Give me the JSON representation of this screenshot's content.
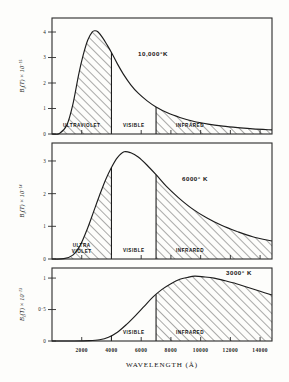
{
  "figure": {
    "xlabel": "WAVELENGTH (Å)",
    "x_ticks": [
      "2000",
      "4000",
      "6000",
      "8000",
      "10000",
      "12000",
      "14000"
    ],
    "x_tick_values": [
      2000,
      4000,
      6000,
      8000,
      10000,
      12000,
      14000
    ],
    "xlim": [
      0,
      14800
    ],
    "visible_band": [
      4000,
      7000
    ],
    "degree_symbol": "°",
    "kelvin_symbol": "K"
  },
  "chart_data": {
    "type": "line",
    "title": "",
    "xlabel": "WAVELENGTH (Å)",
    "ylabel": "Bλ(T)",
    "xlim": [
      0,
      14800
    ],
    "grid": false,
    "legend": "none",
    "panels": [
      {
        "id": "panel-10000k",
        "temperature_label": "10,000°K",
        "temperature_value": 10000,
        "y_axis_label_base": "B",
        "y_axis_label_sub": "λ",
        "y_axis_label_mid": "(T) × 10",
        "y_axis_label_exp": "−15",
        "y_ticks": [
          "1",
          "2",
          "3",
          "4"
        ],
        "y_tick_values": [
          1,
          2,
          3,
          4
        ],
        "ylim": [
          0,
          4.55
        ],
        "zero_tick": "0",
        "peak_wavelength": 2900,
        "peak_value": 4.05,
        "bands": [
          {
            "name": "ULTRAVIOLET",
            "range": [
              0,
              4000
            ],
            "hatched": true
          },
          {
            "name": "VISIBLE",
            "range": [
              4000,
              7000
            ],
            "hatched": false
          },
          {
            "name": "INFRARED",
            "range": [
              7000,
              14800
            ],
            "hatched": true
          }
        ],
        "x": [
          0,
          500,
          1000,
          1400,
          1800,
          2100,
          2400,
          2700,
          2900,
          3100,
          3400,
          3700,
          4000,
          4400,
          4800,
          5300,
          5800,
          6400,
          7000,
          7800,
          8600,
          9500,
          10500,
          11500,
          12500,
          13500,
          14800
        ],
        "y": [
          0,
          0.02,
          0.35,
          1.15,
          2.35,
          3.1,
          3.68,
          4.0,
          4.05,
          4.0,
          3.78,
          3.5,
          3.2,
          2.75,
          2.35,
          1.93,
          1.6,
          1.3,
          1.06,
          0.82,
          0.65,
          0.5,
          0.39,
          0.31,
          0.25,
          0.2,
          0.16
        ]
      },
      {
        "id": "panel-6000k",
        "temperature_label": "6000° K",
        "temperature_value": 6000,
        "y_axis_label_base": "B",
        "y_axis_label_sub": "λ",
        "y_axis_label_mid": "(T) × 10",
        "y_axis_label_exp": "−14",
        "y_ticks": [
          "0",
          "1",
          "2",
          "3"
        ],
        "y_tick_values": [
          0,
          1,
          2,
          3
        ],
        "ylim": [
          0,
          3.55
        ],
        "zero_tick": "0",
        "peak_wavelength": 4850,
        "peak_value": 3.28,
        "bands": [
          {
            "name": "ULTRA VIOLET",
            "name_line1": "ULTRA",
            "name_line2": "VIOLET",
            "range": [
              0,
              4000
            ],
            "hatched": true
          },
          {
            "name": "VISIBLE",
            "range": [
              4000,
              7000
            ],
            "hatched": false
          },
          {
            "name": "INFRARED",
            "range": [
              7000,
              14800
            ],
            "hatched": true
          }
        ],
        "x": [
          0,
          800,
          1400,
          1900,
          2400,
          2800,
          3200,
          3600,
          4000,
          4400,
          4850,
          5300,
          5800,
          6400,
          7000,
          7700,
          8500,
          9400,
          10400,
          11400,
          12400,
          13500,
          14800
        ],
        "y": [
          0,
          0.01,
          0.12,
          0.42,
          0.95,
          1.45,
          1.95,
          2.42,
          2.8,
          3.1,
          3.28,
          3.25,
          3.12,
          2.87,
          2.58,
          2.22,
          1.88,
          1.55,
          1.26,
          1.03,
          0.85,
          0.68,
          0.55
        ]
      },
      {
        "id": "panel-3000k",
        "temperature_label": "3000° K",
        "temperature_value": 3000,
        "y_axis_label_base": "B",
        "y_axis_label_sub": "λ",
        "y_axis_label_mid": "(T) × 10",
        "y_axis_label_exp": "−13",
        "y_ticks": [
          "0",
          "0·5",
          "1"
        ],
        "y_tick_values": [
          0,
          0.5,
          1
        ],
        "ylim": [
          0,
          1.16
        ],
        "zero_tick": "0",
        "peak_wavelength": 9600,
        "peak_value": 1.03,
        "bands": [
          {
            "name": "VISIBLE",
            "range": [
              4000,
              7000
            ],
            "hatched": false
          },
          {
            "name": "INFRARED",
            "range": [
              7000,
              14800
            ],
            "hatched": true
          }
        ],
        "x": [
          0,
          1500,
          2500,
          3200,
          3800,
          4400,
          5000,
          5600,
          6200,
          6800,
          7400,
          8000,
          8600,
          9100,
          9600,
          10200,
          10900,
          11600,
          12400,
          13200,
          14000,
          14800
        ],
        "y": [
          0,
          0.0,
          0.005,
          0.02,
          0.06,
          0.14,
          0.26,
          0.4,
          0.55,
          0.7,
          0.82,
          0.91,
          0.98,
          1.01,
          1.03,
          1.02,
          1.0,
          0.96,
          0.91,
          0.85,
          0.79,
          0.73
        ]
      }
    ]
  }
}
